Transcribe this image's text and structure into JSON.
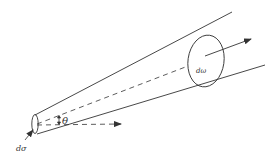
{
  "diagram": {
    "type": "scattering-cross-section-cone",
    "labels": {
      "source_area": "dσ",
      "solid_angle": "dω",
      "angle": "θ"
    },
    "colors": {
      "line": "#333333",
      "background": "#ffffff"
    }
  }
}
